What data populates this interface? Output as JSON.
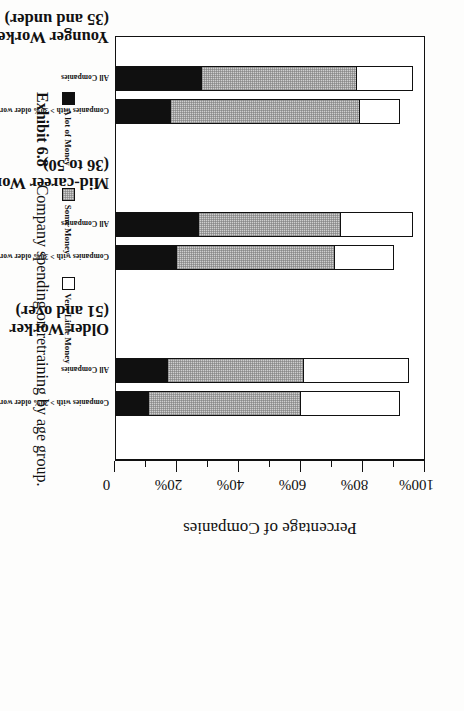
{
  "figure": {
    "exhibit_number": "Exhibit 6.8",
    "caption": "Company spending on retraining by age group.",
    "axis_title": "Percentage of Companies"
  },
  "axis": {
    "major_ticks": [
      {
        "value": 0,
        "label": "0"
      },
      {
        "value": 20,
        "label": "20%"
      },
      {
        "value": 40,
        "label": "40%"
      },
      {
        "value": 60,
        "label": "60%"
      },
      {
        "value": 80,
        "label": "80%"
      },
      {
        "value": 100,
        "label": "100%"
      }
    ],
    "minor_ticks": [
      10,
      30,
      50,
      70,
      90
    ],
    "min": 0,
    "max": 100
  },
  "legend": {
    "items": [
      {
        "label": "A lot of Money",
        "swatch": "black",
        "color": "#101010"
      },
      {
        "label": "Some Money",
        "swatch": "gray",
        "color": "#cfcfcf"
      },
      {
        "label": "Very Little Money",
        "swatch": "white",
        "color": "#ffffff"
      }
    ]
  },
  "groups": [
    {
      "title": "Younger Worker",
      "subtitle": "(35 and under)",
      "bars": [
        {
          "label": "All Companies",
          "a_lot": 28,
          "some": 50,
          "very_little": 18,
          "total": 96
        },
        {
          "label": "Companies with > 30% older workers",
          "a_lot": 18,
          "some": 61,
          "very_little": 13,
          "total": 92
        }
      ]
    },
    {
      "title": "Mid-career Worker",
      "subtitle": "(36 to 50)",
      "bars": [
        {
          "label": "All Companies",
          "a_lot": 27,
          "some": 46,
          "very_little": 23,
          "total": 96
        },
        {
          "label": "Companies with > 30% older workers",
          "a_lot": 20,
          "some": 51,
          "very_little": 19,
          "total": 90
        }
      ]
    },
    {
      "title": "Older Worker",
      "subtitle": "(51 and over)",
      "bars": [
        {
          "label": "All Companies",
          "a_lot": 17,
          "some": 44,
          "very_little": 34,
          "total": 95
        },
        {
          "label": "Companies with > 30% older workers",
          "a_lot": 11,
          "some": 49,
          "very_little": 32,
          "total": 92
        }
      ]
    }
  ],
  "chart_data": {
    "type": "bar",
    "orientation": "stacked-horizontal",
    "title": "Company spending on retraining by age group.",
    "xlabel": "Percentage of Companies",
    "ylabel": "",
    "xlim": [
      0,
      100
    ],
    "grid": false,
    "legend_position": "bottom-left",
    "categories": [
      "Younger Worker (35 and under) — All Companies",
      "Younger Worker (35 and under) — Companies with > 30% older workers",
      "Mid-career Worker (36 to 50) — All Companies",
      "Mid-career Worker (36 to 50) — Companies with > 30% older workers",
      "Older Worker (51 and over) — All Companies",
      "Older Worker (51 and over) — Companies with > 30% older workers"
    ],
    "series": [
      {
        "name": "A lot of Money",
        "color": "#101010",
        "values": [
          28,
          18,
          27,
          20,
          17,
          11
        ]
      },
      {
        "name": "Some Money",
        "color": "#cfcfcf",
        "values": [
          50,
          61,
          46,
          51,
          44,
          49
        ]
      },
      {
        "name": "Very Little Money",
        "color": "#ffffff",
        "values": [
          18,
          13,
          23,
          19,
          34,
          32
        ]
      }
    ],
    "tick_labels": [
      "0",
      "20%",
      "40%",
      "60%",
      "80%",
      "100%"
    ],
    "tick_values": [
      0,
      20,
      40,
      60,
      80,
      100
    ],
    "minor_tick_values": [
      10,
      30,
      50,
      70,
      90
    ]
  }
}
